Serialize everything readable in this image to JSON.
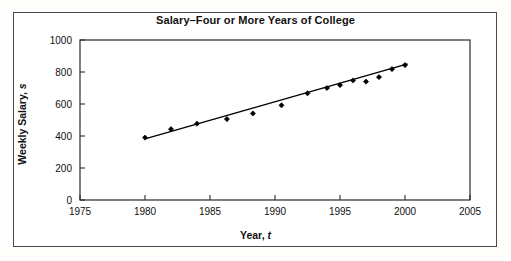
{
  "figure": {
    "title": "Salary–Four or More Years of College",
    "xlabel_main": "Year,",
    "xlabel_var": "t",
    "ylabel_main": "Weekly Salary,",
    "ylabel_var": "s"
  },
  "chart_data": {
    "type": "scatter",
    "title": "Salary–Four or More Years of College",
    "xlabel": "Year, t",
    "ylabel": "Weekly Salary, s",
    "xlim": [
      1975,
      2005
    ],
    "ylim": [
      0,
      1000
    ],
    "xticks": [
      1975,
      1980,
      1985,
      1990,
      1995,
      2000,
      2005
    ],
    "yticks": [
      0,
      200,
      400,
      600,
      800,
      1000
    ],
    "grid": false,
    "legend": "none",
    "marker": "diamond",
    "marker_color": "#000000",
    "line_color": "#000000",
    "series": [
      {
        "name": "Weekly salary",
        "type": "scatter",
        "x": [
          1980.0,
          1982.0,
          1984.0,
          1986.3,
          1988.3,
          1990.5,
          1992.5,
          1994.0,
          1995.0,
          1996.0,
          1997.0,
          1998.0,
          1999.0,
          2000.0
        ],
        "y": [
          390,
          443,
          477,
          506,
          541,
          592,
          667,
          700,
          718,
          747,
          740,
          768,
          818,
          843
        ]
      },
      {
        "name": "Linear regression line",
        "type": "line",
        "x": [
          1980.0,
          2000.2
        ],
        "y": [
          382,
          851
        ]
      }
    ]
  },
  "axis_tick_labels": {
    "x": [
      "1975",
      "1980",
      "1985",
      "1990",
      "1995",
      "2000",
      "2005"
    ],
    "y": [
      "0",
      "200",
      "400",
      "600",
      "800",
      "1000"
    ]
  }
}
